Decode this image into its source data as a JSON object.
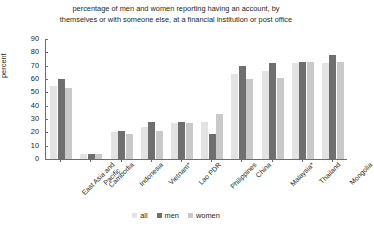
{
  "chart_data": {
    "type": "bar",
    "title": "percentage of men and women reporting having an account, by themselves or with someone else, at a financial institution or post office",
    "title_line1": "percentage of men and women reporting having an account, by",
    "title_line2": "themselves or with someone else, at a financial institution or post office",
    "xlabel": "",
    "ylabel": "percent",
    "ylim": [
      0,
      90
    ],
    "ytick_step": 10,
    "yticks": [
      90,
      80,
      70,
      60,
      50,
      40,
      30,
      20,
      10,
      0
    ],
    "grid": false,
    "legend_position": "bottom",
    "categories": [
      "East Asia and\nPacific",
      "Cambodia",
      "Indonesia",
      "Vietnam*",
      "Lao PDR",
      "Philippines",
      "China",
      "Malaysia*",
      "Thailand",
      "Mongolia"
    ],
    "series": [
      {
        "name": "all",
        "color": "#e3e3e3",
        "values": [
          55,
          4,
          20,
          24,
          27,
          28,
          64,
          66,
          72,
          72
        ]
      },
      {
        "name": "men",
        "color": "#6f6f6f",
        "values": [
          60,
          4,
          21,
          28,
          28,
          19,
          70,
          72,
          73,
          78
        ]
      },
      {
        "name": "women",
        "color": "#c9c9c9",
        "values": [
          53,
          4,
          19,
          21,
          27,
          34,
          60,
          61,
          73,
          73
        ]
      }
    ]
  },
  "legend": {
    "items": [
      {
        "label": "all",
        "color": "#e3e3e3"
      },
      {
        "label": "men",
        "color": "#6f6f6f"
      },
      {
        "label": "women",
        "color": "#c9c9c9"
      }
    ]
  }
}
